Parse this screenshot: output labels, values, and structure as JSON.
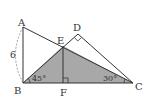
{
  "figure": {
    "type": "geometry-diagram",
    "points": {
      "A": {
        "label": "A",
        "x": 23,
        "y": 27
      },
      "B": {
        "label": "B",
        "x": 23,
        "y": 83
      },
      "C": {
        "label": "C",
        "x": 133,
        "y": 83
      },
      "D": {
        "label": "D",
        "x": 78,
        "y": 34
      },
      "E": {
        "label": "E",
        "x": 63,
        "y": 46
      },
      "F": {
        "label": "F",
        "x": 63,
        "y": 83
      }
    },
    "segments": [
      "AB",
      "AC",
      "BD",
      "DC",
      "BC",
      "EF"
    ],
    "shaded_region": {
      "polygon": "BEC",
      "color": "#a8a8a8"
    },
    "right_angles": [
      "D",
      "F"
    ],
    "angle_labels": {
      "B": "45°",
      "C": "30°"
    },
    "length_labels": {
      "AB": "6"
    },
    "colors": {
      "line": "#333333",
      "shade": "#a8a8a8",
      "dashed_arc": "#888888"
    }
  }
}
